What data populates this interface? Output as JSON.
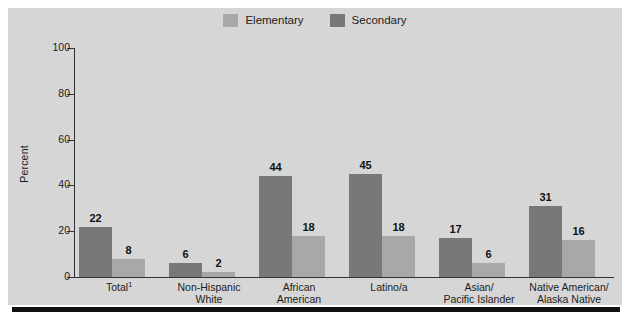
{
  "chart_data": {
    "type": "bar",
    "title": "",
    "xlabel": "",
    "ylabel": "Percent",
    "ylim": [
      0,
      100
    ],
    "ytick_values": [
      0,
      20,
      40,
      60,
      80,
      100
    ],
    "ytick_labels": [
      "0",
      "20",
      "40",
      "60",
      "80",
      "100"
    ],
    "grid": false,
    "legend_position": "top-center",
    "categories": [
      "Total¹",
      "Non-Hispanic White",
      "African American",
      "Latino/a",
      "Asian/ Pacific Islander",
      "Native American/ Alaska Native"
    ],
    "category_lines": [
      [
        "Total",
        ""
      ],
      [
        "Non-Hispanic",
        "White"
      ],
      [
        "African",
        "American"
      ],
      [
        "Latino/a",
        ""
      ],
      [
        "Asian/",
        "Pacific Islander"
      ],
      [
        "Native American/",
        "Alaska Native"
      ]
    ],
    "series": [
      {
        "name": "Secondary",
        "color": "#787878",
        "values": [
          22,
          6,
          44,
          45,
          17,
          31
        ],
        "labels": [
          "22",
          "6",
          "44",
          "45",
          "17",
          "31"
        ]
      },
      {
        "name": "Elementary",
        "color": "#a8a8a8",
        "values": [
          8,
          2,
          18,
          18,
          6,
          16
        ],
        "labels": [
          "8",
          "2",
          "18",
          "18",
          "6",
          "16"
        ]
      }
    ]
  },
  "legend": {
    "entries": [
      {
        "label": "Elementary",
        "color": "#a8a8a8"
      },
      {
        "label": "Secondary",
        "color": "#787878"
      }
    ]
  },
  "axis": {
    "y_title": "Percent"
  },
  "footnote_marker": "1"
}
